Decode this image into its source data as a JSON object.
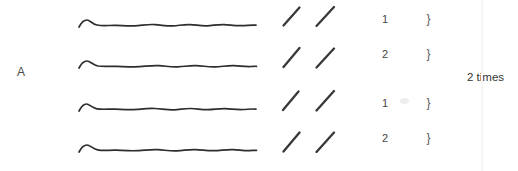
{
  "colors": {
    "background": "#ffffff",
    "ink": "#2d2d2d",
    "text": "#454545"
  },
  "diagram": {
    "section_label": "A",
    "repeat_count_label": "2 times",
    "brace_char": "}",
    "slashes_per_line": 2,
    "rows": [
      {
        "ending_number": "1"
      },
      {
        "ending_number": "2"
      },
      {
        "ending_number": "1"
      },
      {
        "ending_number": "2"
      }
    ]
  }
}
